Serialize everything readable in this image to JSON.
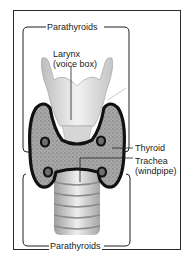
{
  "diagram": {
    "type": "anatomical-illustration",
    "labels": {
      "parathyroids_top": "Parathyroids",
      "larynx_line1": "Larynx",
      "larynx_line2": "(voice box)",
      "thyroid": "Thyroid",
      "trachea_line1": "Trachea",
      "trachea_line2": "(windpipe)",
      "parathyroids_bottom": "Parathyroids"
    },
    "colors": {
      "outline": "#111111",
      "frame": "#2a2a2a",
      "cartilage": "#e4e4e4",
      "gland_tissue": "#9a9a9a",
      "trachea_rings": "#cfcfcf"
    }
  }
}
